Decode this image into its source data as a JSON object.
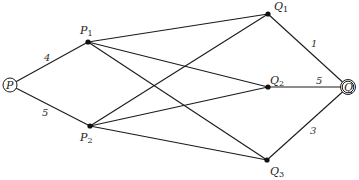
{
  "diagram": {
    "type": "network-graph",
    "nodes": [
      {
        "id": "P",
        "label": "P",
        "sub": "",
        "x": 10,
        "y": 85,
        "shape": "circle",
        "lx": 6,
        "ly": 89
      },
      {
        "id": "P1",
        "label": "P",
        "sub": "1",
        "x": 88,
        "y": 42,
        "shape": "dot",
        "lx": 80,
        "ly": 34
      },
      {
        "id": "P2",
        "label": "P",
        "sub": "2",
        "x": 90,
        "y": 126,
        "shape": "dot",
        "lx": 80,
        "ly": 141
      },
      {
        "id": "Q1",
        "label": "Q",
        "sub": "1",
        "x": 268,
        "y": 14,
        "shape": "dot",
        "lx": 274,
        "ly": 10
      },
      {
        "id": "Q2",
        "label": "Q",
        "sub": "2",
        "x": 268,
        "y": 87,
        "shape": "dot",
        "lx": 270,
        "ly": 84
      },
      {
        "id": "Q3",
        "label": "Q",
        "sub": "3",
        "x": 267,
        "y": 160,
        "shape": "dot",
        "lx": 270,
        "ly": 175
      },
      {
        "id": "Q",
        "label": "Q",
        "sub": "",
        "x": 348,
        "y": 87,
        "shape": "double-circle",
        "lx": 344,
        "ly": 91
      }
    ],
    "edges": [
      {
        "from": "P",
        "to": "P1",
        "weight": "4",
        "wx": 44,
        "wy": 61
      },
      {
        "from": "P",
        "to": "P2",
        "weight": "5",
        "wx": 42,
        "wy": 116
      },
      {
        "from": "P1",
        "to": "Q1",
        "weight": ""
      },
      {
        "from": "P1",
        "to": "Q2",
        "weight": ""
      },
      {
        "from": "P1",
        "to": "Q3",
        "weight": ""
      },
      {
        "from": "P2",
        "to": "Q1",
        "weight": ""
      },
      {
        "from": "P2",
        "to": "Q2",
        "weight": ""
      },
      {
        "from": "P2",
        "to": "Q3",
        "weight": ""
      },
      {
        "from": "Q1",
        "to": "Q",
        "weight": "1",
        "wx": 311,
        "wy": 47
      },
      {
        "from": "Q2",
        "to": "Q",
        "weight": "5",
        "wx": 316,
        "wy": 84
      },
      {
        "from": "Q3",
        "to": "Q",
        "weight": "3",
        "wx": 310,
        "wy": 134
      }
    ]
  }
}
